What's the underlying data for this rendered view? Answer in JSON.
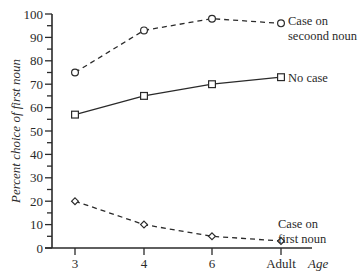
{
  "chart_data": {
    "type": "line",
    "title": "",
    "xlabel": "Age",
    "ylabel": "Percent choice of first noun",
    "categories": [
      "3",
      "4",
      "6",
      "Adult"
    ],
    "ylim": [
      0,
      100
    ],
    "yticks": [
      0,
      10,
      20,
      30,
      40,
      50,
      60,
      70,
      80,
      90,
      100
    ],
    "grid": false,
    "legend_position": "inline-right",
    "series": [
      {
        "name": "Case on secoond noun",
        "label_lines": [
          "Case on",
          "secoond noun"
        ],
        "marker": "circle",
        "line": "dashed",
        "values": [
          75,
          93,
          98,
          96
        ]
      },
      {
        "name": "No case",
        "label_lines": [
          "No case"
        ],
        "marker": "square",
        "line": "solid",
        "values": [
          57,
          65,
          70,
          73
        ]
      },
      {
        "name": "Case on first noun",
        "label_lines": [
          "Case on",
          "first noun"
        ],
        "marker": "diamond",
        "line": "dashed",
        "values": [
          20,
          10,
          5,
          3
        ]
      }
    ],
    "colors": {
      "ink": "#2a2a2a",
      "background": "#ffffff"
    }
  }
}
